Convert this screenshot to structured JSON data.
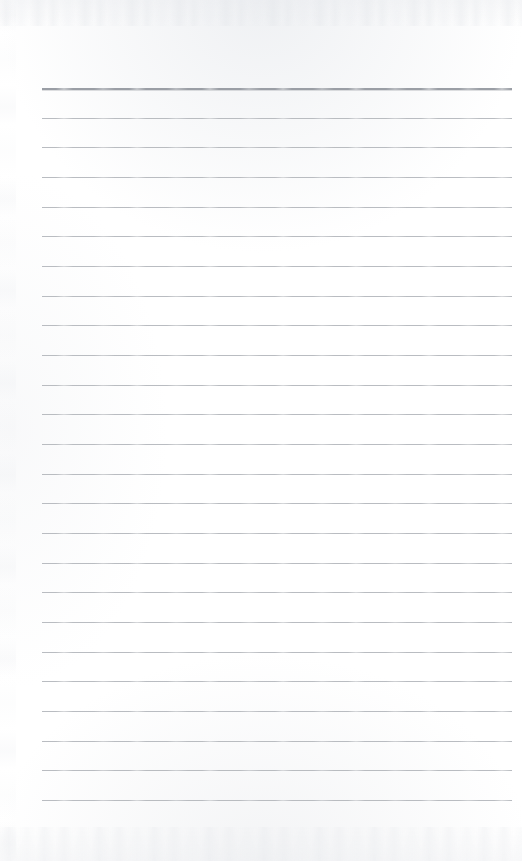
{
  "document": {
    "kind": "scanned-ruled-page",
    "description": "Blank scanned ruled notepad page with no written content",
    "page_width": 522,
    "page_height": 861,
    "paper_color": "#fefefe",
    "written_text": "",
    "visible_text_items": []
  },
  "ruling": {
    "line_color": "#b4b7bc",
    "header_line_color": "#9a9ea5",
    "line_count": 25,
    "line_left_x": 42,
    "line_right_x": 512,
    "line_width": 470,
    "first_line_y": 88,
    "last_line_y": 800,
    "line_spacing": 29.7,
    "line_thickness": 1,
    "header_line_thickness": 2,
    "header_line_index": 0,
    "lines": [
      {
        "index": 0,
        "y": 88,
        "emphasis": "header"
      },
      {
        "index": 1,
        "y": 118,
        "emphasis": "normal"
      },
      {
        "index": 2,
        "y": 147,
        "emphasis": "normal"
      },
      {
        "index": 3,
        "y": 177,
        "emphasis": "normal"
      },
      {
        "index": 4,
        "y": 207,
        "emphasis": "normal"
      },
      {
        "index": 5,
        "y": 236,
        "emphasis": "normal"
      },
      {
        "index": 6,
        "y": 266,
        "emphasis": "normal"
      },
      {
        "index": 7,
        "y": 296,
        "emphasis": "normal"
      },
      {
        "index": 8,
        "y": 325,
        "emphasis": "normal"
      },
      {
        "index": 9,
        "y": 355,
        "emphasis": "normal"
      },
      {
        "index": 10,
        "y": 385,
        "emphasis": "normal"
      },
      {
        "index": 11,
        "y": 414,
        "emphasis": "normal"
      },
      {
        "index": 12,
        "y": 444,
        "emphasis": "normal"
      },
      {
        "index": 13,
        "y": 474,
        "emphasis": "normal"
      },
      {
        "index": 14,
        "y": 503,
        "emphasis": "normal"
      },
      {
        "index": 15,
        "y": 533,
        "emphasis": "normal"
      },
      {
        "index": 16,
        "y": 563,
        "emphasis": "normal"
      },
      {
        "index": 17,
        "y": 592,
        "emphasis": "normal"
      },
      {
        "index": 18,
        "y": 622,
        "emphasis": "normal"
      },
      {
        "index": 19,
        "y": 652,
        "emphasis": "normal"
      },
      {
        "index": 20,
        "y": 681,
        "emphasis": "normal"
      },
      {
        "index": 21,
        "y": 711,
        "emphasis": "normal"
      },
      {
        "index": 22,
        "y": 741,
        "emphasis": "normal"
      },
      {
        "index": 23,
        "y": 770,
        "emphasis": "normal"
      },
      {
        "index": 24,
        "y": 800,
        "emphasis": "normal"
      }
    ]
  },
  "margins": {
    "top_blank_height": 88,
    "bottom_blank_height": 61,
    "left_blank_width": 42,
    "right_blank_width": 10
  },
  "scan_artifacts": {
    "top_noise_band": true,
    "bottom_noise_band": true,
    "left_edge_speckle": true,
    "noise_color": "#e6e8ec"
  }
}
